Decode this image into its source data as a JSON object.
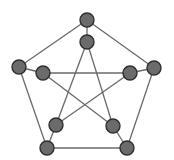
{
  "diagram": {
    "colors": {
      "background": "#ffffff",
      "edge": "#6a6a6a",
      "node_fill": "#6b6b6b",
      "node_stroke": "#2e2e2e"
    },
    "node_radius": 7,
    "nodes": [
      {
        "id": "outer-top",
        "x": 87,
        "y": 20
      },
      {
        "id": "outer-right",
        "x": 154,
        "y": 68
      },
      {
        "id": "outer-bottom-right",
        "x": 127,
        "y": 148
      },
      {
        "id": "outer-bottom-left",
        "x": 47,
        "y": 148
      },
      {
        "id": "outer-left",
        "x": 19,
        "y": 67
      },
      {
        "id": "inner-top",
        "x": 87,
        "y": 42
      },
      {
        "id": "inner-right",
        "x": 130,
        "y": 73
      },
      {
        "id": "inner-bottom-right",
        "x": 113,
        "y": 126
      },
      {
        "id": "inner-bottom-left",
        "x": 56,
        "y": 125
      },
      {
        "id": "inner-left",
        "x": 43,
        "y": 73
      }
    ],
    "edges": [
      [
        "outer-top",
        "outer-right"
      ],
      [
        "outer-right",
        "outer-bottom-right"
      ],
      [
        "outer-bottom-right",
        "outer-bottom-left"
      ],
      [
        "outer-bottom-left",
        "outer-left"
      ],
      [
        "outer-left",
        "outer-top"
      ],
      [
        "outer-top",
        "inner-top"
      ],
      [
        "outer-right",
        "inner-right"
      ],
      [
        "outer-bottom-right",
        "inner-bottom-right"
      ],
      [
        "outer-bottom-left",
        "inner-bottom-left"
      ],
      [
        "outer-left",
        "inner-left"
      ],
      [
        "inner-top",
        "inner-bottom-left"
      ],
      [
        "inner-top",
        "inner-bottom-right"
      ],
      [
        "inner-left",
        "inner-right"
      ],
      [
        "inner-left",
        "inner-bottom-right"
      ],
      [
        "inner-right",
        "inner-bottom-left"
      ]
    ]
  }
}
